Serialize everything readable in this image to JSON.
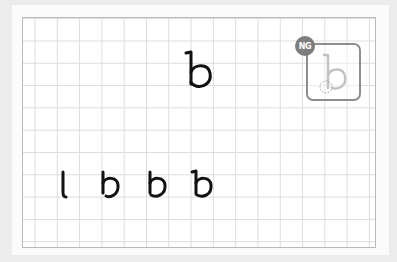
{
  "canvas": {
    "grid_color": "#dcdcdc",
    "border_color": "#b9b9b9",
    "ink_color": "#111111"
  },
  "target_letter": {
    "glyph": "b",
    "stroke": "handwritten"
  },
  "result": {
    "badge_label": "NG",
    "badge_color": "#7e7e7e",
    "frame_color": "#8e8e8e",
    "glyph": "b",
    "marker": "dotted-circle"
  },
  "practice_row": {
    "glyphs": [
      "l",
      "b",
      "b",
      "b"
    ]
  }
}
